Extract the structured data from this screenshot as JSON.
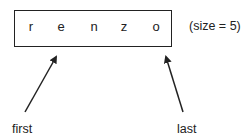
{
  "array": {
    "cells": [
      "r",
      "e",
      "n",
      "z",
      "o"
    ],
    "size_label": "(size = 5)"
  },
  "pointers": {
    "first": "first",
    "last": "last"
  }
}
